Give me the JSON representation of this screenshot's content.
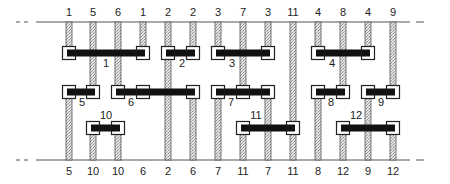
{
  "diagram": {
    "type": "connector-network",
    "top_line_y": 22,
    "bottom_line_y": 160,
    "columns_x": [
      69,
      93,
      118,
      143,
      168,
      193,
      218,
      243,
      268,
      293,
      318,
      343,
      368,
      393
    ],
    "top_labels": [
      "1",
      "5",
      "6",
      "1",
      "2",
      "2",
      "3",
      "7",
      "3",
      "11",
      "4",
      "8",
      "4",
      "9"
    ],
    "bottom_labels": [
      "5",
      "10",
      "10",
      "6",
      "2",
      "6",
      "7",
      "11",
      "7",
      "11",
      "8",
      "12",
      "9",
      "12"
    ],
    "connectors": [
      {
        "label": "1",
        "row_y": 53,
        "from_col": 0,
        "to_col": 3,
        "mid_cols": [],
        "label_x": 106,
        "label_y": 67
      },
      {
        "label": "2",
        "row_y": 53,
        "from_col": 4,
        "to_col": 5,
        "mid_cols": [],
        "label_x": 182,
        "label_y": 67
      },
      {
        "label": "3",
        "row_y": 53,
        "from_col": 6,
        "to_col": 8,
        "mid_cols": [],
        "label_x": 232,
        "label_y": 67
      },
      {
        "label": "4",
        "row_y": 53,
        "from_col": 10,
        "to_col": 12,
        "mid_cols": [],
        "label_x": 332,
        "label_y": 67
      },
      {
        "label": "5",
        "row_y": 92,
        "from_col": 0,
        "to_col": 1,
        "mid_cols": [],
        "label_x": 82,
        "label_y": 106
      },
      {
        "label": "6",
        "row_y": 92,
        "from_col": 2,
        "to_col": 5,
        "mid_cols": [
          3
        ],
        "label_x": 131,
        "label_y": 106
      },
      {
        "label": "7",
        "row_y": 92,
        "from_col": 6,
        "to_col": 8,
        "mid_cols": [
          7
        ],
        "label_x": 231,
        "label_y": 106
      },
      {
        "label": "8",
        "row_y": 92,
        "from_col": 10,
        "to_col": 11,
        "mid_cols": [],
        "label_x": 331,
        "label_y": 106
      },
      {
        "label": "9",
        "row_y": 92,
        "from_col": 12,
        "to_col": 13,
        "mid_cols": [],
        "label_x": 381,
        "label_y": 106
      },
      {
        "label": "10",
        "row_y": 128,
        "from_col": 1,
        "to_col": 2,
        "mid_cols": [],
        "label_x": 106,
        "label_y": 119
      },
      {
        "label": "11",
        "row_y": 128,
        "from_col": 7,
        "to_col": 9,
        "mid_cols": [],
        "label_x": 256,
        "label_y": 119
      },
      {
        "label": "12",
        "row_y": 128,
        "from_col": 11,
        "to_col": 13,
        "mid_cols": [],
        "label_x": 356,
        "label_y": 119
      }
    ],
    "wires": [
      {
        "col": 0,
        "top_end": "1",
        "bottom_end": "5",
        "segments": [
          [
            22,
            53
          ],
          [
            92,
            160
          ]
        ]
      },
      {
        "col": 1,
        "top_end": "5",
        "bottom_end": "10",
        "segments": [
          [
            22,
            92
          ],
          [
            128,
            160
          ]
        ]
      },
      {
        "col": 2,
        "top_end": "6",
        "bottom_end": "10",
        "segments": [
          [
            22,
            92
          ],
          [
            128,
            160
          ]
        ]
      },
      {
        "col": 3,
        "top_end": "1",
        "bottom_end": "6",
        "segments": [
          [
            22,
            53
          ],
          [
            92,
            92
          ]
        ]
      },
      {
        "col": 4,
        "top_end": "2",
        "bottom_end": "2",
        "segments": [
          [
            22,
            53
          ],
          [
            53,
            160
          ]
        ]
      },
      {
        "col": 5,
        "top_end": "2",
        "bottom_end": "6",
        "segments": [
          [
            22,
            53
          ],
          [
            92,
            160
          ]
        ]
      },
      {
        "col": 6,
        "top_end": "3",
        "bottom_end": "7",
        "segments": [
          [
            22,
            53
          ],
          [
            92,
            160
          ]
        ]
      },
      {
        "col": 7,
        "top_end": "7",
        "bottom_end": "11",
        "segments": [
          [
            22,
            92
          ],
          [
            128,
            160
          ]
        ]
      },
      {
        "col": 8,
        "top_end": "3",
        "bottom_end": "7",
        "segments": [
          [
            22,
            53
          ],
          [
            92,
            160
          ]
        ]
      },
      {
        "col": 9,
        "top_end": "11",
        "bottom_end": "11",
        "segments": [
          [
            22,
            160
          ]
        ]
      },
      {
        "col": 10,
        "top_end": "4",
        "bottom_end": "8",
        "segments": [
          [
            22,
            53
          ],
          [
            92,
            160
          ]
        ]
      },
      {
        "col": 11,
        "top_end": "8",
        "bottom_end": "12",
        "segments": [
          [
            22,
            92
          ],
          [
            128,
            160
          ]
        ]
      },
      {
        "col": 12,
        "top_end": "4",
        "bottom_end": "9",
        "segments": [
          [
            22,
            53
          ],
          [
            92,
            160
          ]
        ]
      },
      {
        "col": 13,
        "top_end": "9",
        "bottom_end": "12",
        "segments": [
          [
            22,
            92
          ],
          [
            128,
            160
          ]
        ]
      }
    ],
    "colors": {
      "line": "#555555",
      "wire_fill": "#d8d8d8",
      "wire_stroke": "#555555",
      "bar": "#111111",
      "node_fill": "#ffffff",
      "node_stroke": "#222222",
      "text": "#222222"
    }
  }
}
